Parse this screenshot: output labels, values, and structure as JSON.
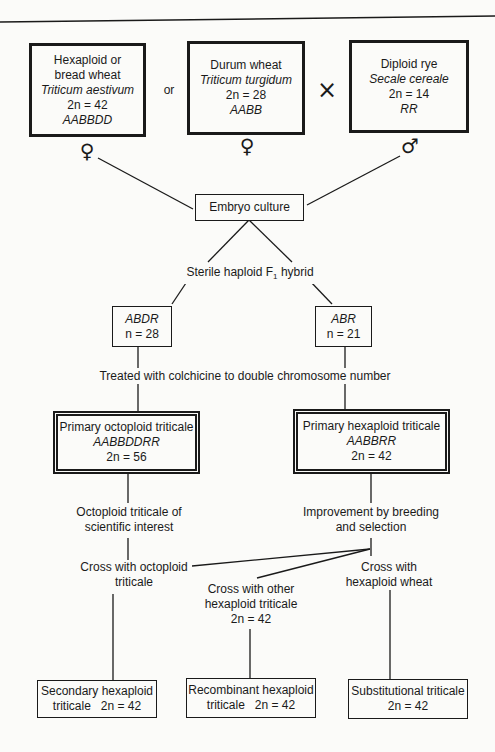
{
  "parents": {
    "hexaploid_wheat": {
      "name_line1": "Hexaploid or",
      "name_line2": "bread wheat",
      "species": "Triticum aestivum",
      "chromosomes": "2n = 42",
      "genome": "AABBDD",
      "sex_symbol": "♀"
    },
    "or_label": "or",
    "durum_wheat": {
      "name": "Durum wheat",
      "species": "Triticum turgidum",
      "chromosomes": "2n = 28",
      "genome": "AABB",
      "sex_symbol": "♀"
    },
    "cross_symbol": "×",
    "diploid_rye": {
      "name": "Diploid rye",
      "species": "Secale cereale",
      "chromosomes": "2n = 14",
      "genome": "RR",
      "sex_symbol": "♂"
    }
  },
  "embryo_culture": "Embryo culture",
  "f1_hybrid": {
    "prefix": "Sterile haploid F",
    "subscript": "1",
    "suffix": " hybrid"
  },
  "haploids": {
    "abdr": {
      "genome": "ABDR",
      "chromosomes": "n = 28"
    },
    "abr": {
      "genome": "ABR",
      "chromosomes": "n = 21"
    }
  },
  "colchicine_step": "Treated with colchicine to double chromosome number",
  "primary": {
    "octoploid": {
      "name": "Primary octoploid triticale",
      "genome": "AABBDDRR",
      "chromosomes": "2n = 56"
    },
    "hexaploid": {
      "name": "Primary hexaploid triticale",
      "genome": "AABBRR",
      "chromosomes": "2n = 42"
    }
  },
  "steps": {
    "octoploid_interest": [
      "Octoploid triticale of",
      "scientific interest"
    ],
    "improvement": [
      "Improvement by breeding",
      "and selection"
    ],
    "cross_octoploid": [
      "Cross with octoploid",
      "triticale"
    ],
    "cross_other_hexaploid": [
      "Cross with other",
      "hexaploid triticale",
      "2n = 42"
    ],
    "cross_hexaploid_wheat": [
      "Cross with",
      "hexaploid wheat"
    ]
  },
  "outcomes": {
    "secondary": [
      "Secondary hexaploid",
      "triticale   2n = 42"
    ],
    "recombinant": [
      "Recombinant hexaploid",
      "triticale   2n = 42"
    ],
    "substitutional": [
      "Substitutional triticale",
      "2n = 42"
    ]
  }
}
